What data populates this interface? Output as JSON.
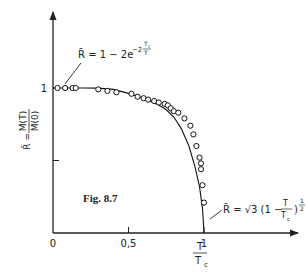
{
  "figure": {
    "caption": "Fig. 8.7"
  },
  "axes": {
    "origin_px": [
      53,
      233
    ],
    "x_end_px": 298,
    "y_end_px": 12,
    "x_scale_px": 151,
    "y_scale_px": 145,
    "x_ticks": [
      {
        "value": 0,
        "label": "0"
      },
      {
        "value": 0.5,
        "label": "0,5"
      },
      {
        "value": 1,
        "label": "1"
      }
    ],
    "y_ticks": [
      {
        "value": 0.5,
        "label": ""
      },
      {
        "value": 1,
        "label": "1"
      }
    ],
    "xlabel": {
      "num": "T",
      "den": "T",
      "den_sub": "c"
    },
    "ylabel": {
      "lhs": "R̄ =",
      "num": "M(T)",
      "den": "M(0)"
    }
  },
  "annotations": {
    "low_T": {
      "text_main": "R̄ = 1 − 2e",
      "exp_prefix": "−2",
      "exp_num": "T",
      "exp_num_sub": "c",
      "exp_den": "T"
    },
    "near_Tc": {
      "text_main": "R̄ = √3  (1 −",
      "frac_num": "T",
      "frac_den": "T",
      "frac_den_sub": "c",
      "close": ")",
      "exp_num": "1",
      "exp_den": "2"
    }
  },
  "chart_data": {
    "type": "scatter",
    "title": "Fig. 8.7",
    "xlabel": "T/Tc",
    "ylabel": "R̄ = M(T)/M(0)",
    "xlim": [
      0,
      1.6
    ],
    "ylim": [
      0,
      1.5
    ],
    "x_ticks": [
      0,
      0.5,
      1
    ],
    "y_ticks": [
      0.5,
      1
    ],
    "grid": false,
    "legend": null,
    "series": [
      {
        "name": "experimental points",
        "marker": "open-circle",
        "points": [
          [
            0.03,
            1.0
          ],
          [
            0.08,
            1.0
          ],
          [
            0.13,
            1.0
          ],
          [
            0.15,
            1.0
          ],
          [
            0.3,
            0.99
          ],
          [
            0.36,
            0.98
          ],
          [
            0.42,
            0.97
          ],
          [
            0.52,
            0.96
          ],
          [
            0.56,
            0.94
          ],
          [
            0.6,
            0.93
          ],
          [
            0.63,
            0.92
          ],
          [
            0.67,
            0.91
          ],
          [
            0.7,
            0.9
          ],
          [
            0.74,
            0.89
          ],
          [
            0.76,
            0.88
          ],
          [
            0.78,
            0.86
          ],
          [
            0.8,
            0.84
          ],
          [
            0.83,
            0.83
          ],
          [
            0.87,
            0.79
          ],
          [
            0.91,
            0.74
          ],
          [
            0.93,
            0.68
          ],
          [
            0.95,
            0.6
          ],
          [
            0.97,
            0.52
          ],
          [
            0.98,
            0.48
          ],
          [
            0.98,
            0.44
          ],
          [
            0.99,
            0.33
          ],
          [
            1.0,
            0.21
          ]
        ]
      },
      {
        "name": "theory curve: R̄ = 1 − 2e^(−2Tc/T) (low T) joined to R̄ = √3 (1 − T/Tc)^(1/2) (near Tc)",
        "type": "line",
        "points": [
          [
            0.0,
            1.0
          ],
          [
            0.2,
            1.0
          ],
          [
            0.3,
            0.999
          ],
          [
            0.4,
            0.99
          ],
          [
            0.5,
            0.963
          ],
          [
            0.6,
            0.929
          ],
          [
            0.7,
            0.882
          ],
          [
            0.75,
            0.85
          ],
          [
            0.8,
            0.8
          ],
          [
            0.85,
            0.72
          ],
          [
            0.9,
            0.6
          ],
          [
            0.94,
            0.46
          ],
          [
            0.97,
            0.32
          ],
          [
            0.99,
            0.17
          ],
          [
            1.0,
            0.0
          ]
        ]
      }
    ],
    "annotations": [
      "R̄ = 1 − 2e^(−2 Tc/T)",
      "R̄ = √3 (1 − T/Tc)^(1/2)"
    ]
  }
}
